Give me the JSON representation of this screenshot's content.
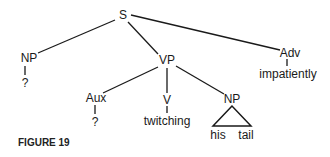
{
  "diagram": {
    "type": "syntax-tree",
    "nodes": [
      {
        "id": "S",
        "label": "S",
        "x": 123,
        "y": 15
      },
      {
        "id": "NP1",
        "label": "NP",
        "x": 29,
        "y": 58
      },
      {
        "id": "NP1_leaf",
        "label": "?",
        "x": 25,
        "y": 83
      },
      {
        "id": "VP",
        "label": "VP",
        "x": 167,
        "y": 60
      },
      {
        "id": "Adv",
        "label": "Adv",
        "x": 290,
        "y": 53
      },
      {
        "id": "Adv_leaf",
        "label": "impatiently",
        "x": 288,
        "y": 74
      },
      {
        "id": "Aux",
        "label": "Aux",
        "x": 96,
        "y": 98
      },
      {
        "id": "Aux_leaf",
        "label": "?",
        "x": 95,
        "y": 122
      },
      {
        "id": "V",
        "label": "V",
        "x": 167,
        "y": 100
      },
      {
        "id": "V_leaf",
        "label": "twitching",
        "x": 167,
        "y": 121
      },
      {
        "id": "NP2",
        "label": "NP",
        "x": 232,
        "y": 99
      },
      {
        "id": "NP2_leaf1",
        "label": "his",
        "x": 218,
        "y": 135
      },
      {
        "id": "NP2_leaf2",
        "label": "tail",
        "x": 246,
        "y": 135
      }
    ],
    "edges": [
      [
        "S",
        "NP1"
      ],
      [
        "S",
        "VP"
      ],
      [
        "S",
        "Adv"
      ],
      [
        "NP1",
        "NP1_leaf"
      ],
      [
        "Adv",
        "Adv_leaf"
      ],
      [
        "VP",
        "Aux"
      ],
      [
        "VP",
        "V"
      ],
      [
        "VP",
        "NP2"
      ],
      [
        "Aux",
        "Aux_leaf"
      ],
      [
        "V",
        "V_leaf"
      ]
    ],
    "triangle": {
      "under": "NP2",
      "children": [
        "his",
        "tail"
      ]
    }
  },
  "caption": "FIGURE 19"
}
